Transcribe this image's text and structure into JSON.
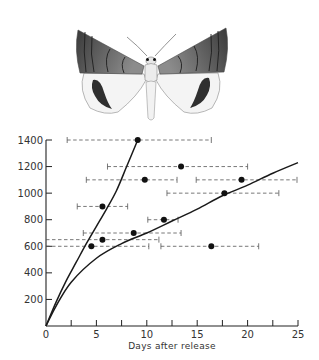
{
  "illustration": {
    "subject": "moth-illustration"
  },
  "chart_data": {
    "type": "scatter",
    "title": "",
    "xlabel": "Days after release",
    "ylabel": "",
    "xlim": [
      0,
      25
    ],
    "ylim": [
      0,
      1400
    ],
    "x_ticks": [
      0,
      5,
      10,
      15,
      20,
      25
    ],
    "x_minor_ticks": [
      2.5,
      7.5,
      12.5,
      17.5,
      22.5
    ],
    "y_ticks": [
      200,
      400,
      600,
      800,
      1000,
      1200,
      1400
    ],
    "grid": false,
    "legend": null,
    "x_tick_labels": [
      "0",
      "5",
      "10",
      "15",
      "20",
      "25"
    ],
    "y_tick_labels": [
      "200",
      "400",
      "600",
      "800",
      "1000",
      "1200",
      "1400"
    ],
    "series": [
      {
        "name": "observations",
        "type": "scatter_with_horizontal_error_bars",
        "points": [
          {
            "x": 9.1,
            "y": 1400,
            "xmin": 2.1,
            "xmax": 16.4
          },
          {
            "x": 13.4,
            "y": 1200,
            "xmin": 6.1,
            "xmax": 20.0
          },
          {
            "x": 9.8,
            "y": 1100,
            "xmin": 4.0,
            "xmax": 13.0
          },
          {
            "x": 19.4,
            "y": 1100,
            "xmin": 14.9,
            "xmax": 24.9
          },
          {
            "x": 17.7,
            "y": 1000,
            "xmin": 12.0,
            "xmax": 23.1
          },
          {
            "x": 5.6,
            "y": 900,
            "xmin": 3.1,
            "xmax": 8.1
          },
          {
            "x": 11.7,
            "y": 800,
            "xmin": 10.1,
            "xmax": 13.1
          },
          {
            "x": 8.7,
            "y": 700,
            "xmin": 3.7,
            "xmax": 13.4
          },
          {
            "x": 5.6,
            "y": 650,
            "xmin": 0.0,
            "xmax": 11.2
          },
          {
            "x": 4.5,
            "y": 600,
            "xmin": 0.0,
            "xmax": 10.2
          },
          {
            "x": 16.4,
            "y": 600,
            "xmin": 11.4,
            "xmax": 21.1
          }
        ]
      },
      {
        "name": "upper-curve",
        "type": "line",
        "x": [
          0,
          1,
          2,
          3,
          4,
          5,
          6,
          7,
          8,
          9.1
        ],
        "y": [
          0,
          180,
          340,
          480,
          620,
          750,
          880,
          1020,
          1200,
          1400
        ]
      },
      {
        "name": "lower-curve",
        "type": "line",
        "x": [
          0,
          1,
          2.5,
          5,
          7.5,
          10,
          12.5,
          15,
          17.5,
          20,
          22.5,
          25
        ],
        "y": [
          0,
          150,
          330,
          510,
          620,
          700,
          790,
          880,
          980,
          1060,
          1150,
          1230
        ]
      }
    ]
  }
}
